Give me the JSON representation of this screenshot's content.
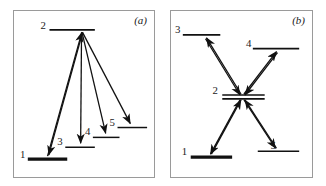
{
  "figure": {
    "title": "",
    "background_color": "#ffffff",
    "line_color": "#111111",
    "frame_color": "#9a9a9a"
  },
  "panels": [
    {
      "id": "a",
      "label": "(a)",
      "levels": [
        {
          "id": "1",
          "label": "1",
          "thick": true,
          "x1": 14,
          "x2": 54,
          "y": 150,
          "label_x": 6,
          "label_y": 146
        },
        {
          "id": "2",
          "label": "2",
          "thick": false,
          "x1": 36,
          "x2": 82,
          "y": 19,
          "label_x": 28,
          "label_y": 15
        },
        {
          "id": "3",
          "label": "3",
          "thick": false,
          "x1": 52,
          "x2": 82,
          "y": 138,
          "label_x": 45,
          "label_y": 133
        },
        {
          "id": "4",
          "label": "4",
          "thick": false,
          "x1": 80,
          "x2": 107,
          "y": 128,
          "label_x": 74,
          "label_y": 122
        },
        {
          "id": "5",
          "label": "5",
          "thick": false,
          "x1": 105,
          "x2": 135,
          "y": 118,
          "label_x": 99,
          "label_y": 113
        }
      ],
      "transitions": [
        {
          "from": "1",
          "to": "2",
          "direction": "up",
          "x1": 34,
          "y1": 147,
          "x2": 68,
          "y2": 21
        },
        {
          "from": "2",
          "to": "1",
          "direction": "down",
          "x1": 68,
          "y1": 21,
          "x2": 34,
          "y2": 147
        },
        {
          "from": "2",
          "to": "3",
          "direction": "down",
          "x1": 68,
          "y1": 21,
          "x2": 67,
          "y2": 135
        },
        {
          "from": "2",
          "to": "4",
          "direction": "down",
          "x1": 68,
          "y1": 21,
          "x2": 93,
          "y2": 125
        },
        {
          "from": "2",
          "to": "5",
          "direction": "down",
          "x1": 68,
          "y1": 21,
          "x2": 118,
          "y2": 115
        }
      ]
    },
    {
      "id": "b",
      "label": "(b)",
      "levels": [
        {
          "id": "1",
          "label": "1",
          "thick": true,
          "x1": 20,
          "x2": 62,
          "y": 148,
          "label_x": 12,
          "label_y": 143
        },
        {
          "id": "2",
          "label": "2",
          "thick": false,
          "x1": 52,
          "x2": 95,
          "y": 85,
          "label_x": 43,
          "label_y": 81
        },
        {
          "id": "3",
          "label": "3",
          "thick": false,
          "x1": 12,
          "x2": 50,
          "y": 24,
          "label_x": 5,
          "label_y": 20
        },
        {
          "id": "4",
          "label": "4",
          "thick": false,
          "x1": 83,
          "x2": 130,
          "y": 38,
          "label_x": 76,
          "label_y": 33
        },
        {
          "id": "5",
          "label": "5",
          "thick": false,
          "x1": 88,
          "x2": 130,
          "y": 142,
          "label_x": 101,
          "label_y": 137
        },
        {
          "id": "2b",
          "label": "",
          "thick": false,
          "x1": 52,
          "x2": 95,
          "y": 88,
          "label_x": 0,
          "label_y": 0
        }
      ],
      "transitions": [
        {
          "from": "2",
          "to": "3",
          "direction": "up",
          "x1": 71,
          "y1": 84,
          "x2": 35,
          "y2": 26
        },
        {
          "from": "3",
          "to": "2",
          "direction": "down",
          "x1": 35,
          "y1": 26,
          "x2": 71,
          "y2": 84
        },
        {
          "from": "2",
          "to": "4",
          "direction": "up",
          "x1": 73,
          "y1": 84,
          "x2": 106,
          "y2": 40
        },
        {
          "from": "4",
          "to": "2",
          "direction": "down",
          "x1": 106,
          "y1": 40,
          "x2": 73,
          "y2": 84
        },
        {
          "from": "1",
          "to": "2",
          "direction": "up",
          "x1": 41,
          "y1": 145,
          "x2": 71,
          "y2": 90
        },
        {
          "from": "2",
          "to": "1",
          "direction": "down",
          "x1": 71,
          "y1": 90,
          "x2": 41,
          "y2": 145
        },
        {
          "from": "2",
          "to": "5",
          "direction": "down",
          "x1": 73,
          "y1": 90,
          "x2": 106,
          "y2": 139
        },
        {
          "from": "5",
          "to": "2",
          "direction": "up",
          "x1": 106,
          "y1": 139,
          "x2": 73,
          "y2": 90
        }
      ]
    }
  ]
}
